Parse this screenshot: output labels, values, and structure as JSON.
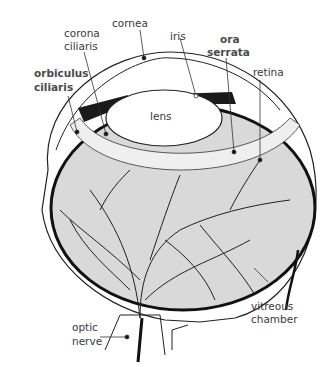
{
  "diagram": {
    "labels": {
      "cornea": "cornea",
      "corona_ciliaris_1": "corona",
      "corona_ciliaris_2": "ciliaris",
      "iris": "iris",
      "ora_serrata_1": "ora",
      "ora_serrata_2": "serrata",
      "orbiculus_ciliaris_1": "orbiculus",
      "orbiculus_ciliaris_2": "ciliaris",
      "retina": "retina",
      "lens": "lens",
      "vitreous_chamber_1": "vitreous",
      "vitreous_chamber_2": "chamber",
      "optic_nerve_1": "optic",
      "optic_nerve_2": "nerve"
    },
    "emphasized_labels": [
      "orbiculus ciliaris",
      "ora serrata"
    ],
    "colors": {
      "background": "#ffffff",
      "line": "#1a1a1a",
      "vitreous_fill": "#d9d9d9",
      "label_text": "#3a3a3a"
    }
  }
}
